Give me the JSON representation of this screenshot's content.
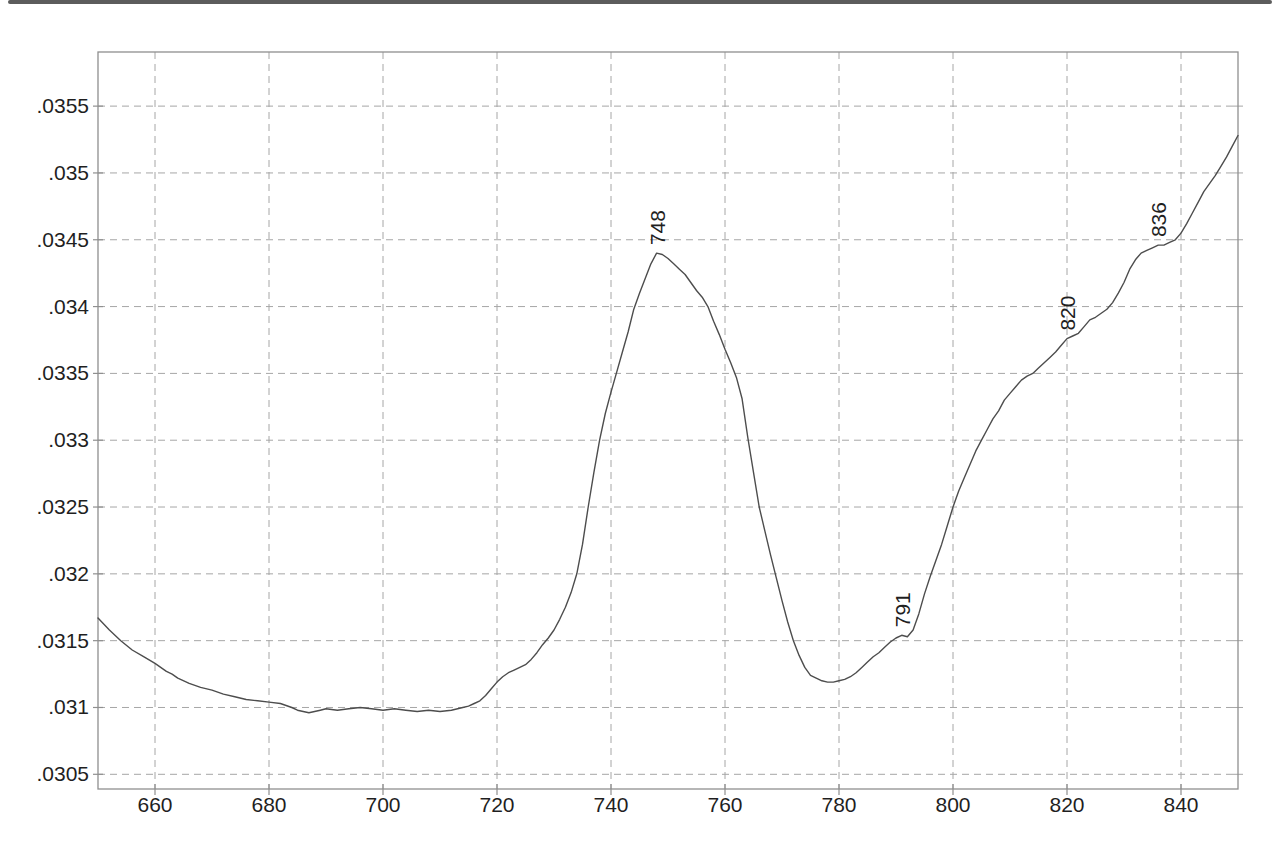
{
  "page": {
    "kind": "scanned-spectrum-plot",
    "background": "#ffffff"
  },
  "chart_data": {
    "type": "line",
    "title": "",
    "xlabel": "",
    "ylabel": "",
    "legend": "none",
    "grid": "dashed-both-axes",
    "xlim": [
      650,
      850
    ],
    "ylim": [
      0.03039,
      0.035905
    ],
    "x_ticks": [
      {
        "value": 660,
        "label": "660"
      },
      {
        "value": 680,
        "label": "680"
      },
      {
        "value": 700,
        "label": "700"
      },
      {
        "value": 720,
        "label": "720"
      },
      {
        "value": 740,
        "label": "740"
      },
      {
        "value": 760,
        "label": "760"
      },
      {
        "value": 780,
        "label": "780"
      },
      {
        "value": 800,
        "label": "800"
      },
      {
        "value": 820,
        "label": "820"
      },
      {
        "value": 840,
        "label": "840"
      }
    ],
    "y_ticks": [
      {
        "value": 0.0355,
        "label": ".0355"
      },
      {
        "value": 0.035,
        "label": ".035"
      },
      {
        "value": 0.0345,
        "label": ".0345"
      },
      {
        "value": 0.034,
        "label": ".034"
      },
      {
        "value": 0.0335,
        "label": ".0335"
      },
      {
        "value": 0.033,
        "label": ".033"
      },
      {
        "value": 0.0325,
        "label": ".0325"
      },
      {
        "value": 0.032,
        "label": ".032"
      },
      {
        "value": 0.0315,
        "label": ".0315"
      },
      {
        "value": 0.031,
        "label": ".031"
      },
      {
        "value": 0.0305,
        "label": ".0305"
      }
    ],
    "annotations": [
      {
        "label": "748",
        "x": 748,
        "y": 0.0344
      },
      {
        "label": "791",
        "x": 791,
        "y": 0.03154
      },
      {
        "label": "820",
        "x": 820,
        "y": 0.03376
      },
      {
        "label": "836",
        "x": 836,
        "y": 0.03446
      }
    ],
    "series": [
      {
        "name": "spectrum",
        "points": [
          [
            650,
            0.03167
          ],
          [
            652,
            0.03158
          ],
          [
            654,
            0.0315
          ],
          [
            656,
            0.03143
          ],
          [
            658,
            0.03138
          ],
          [
            660,
            0.03133
          ],
          [
            662,
            0.03127
          ],
          [
            663,
            0.03125
          ],
          [
            664,
            0.03122
          ],
          [
            666,
            0.03118
          ],
          [
            668,
            0.03115
          ],
          [
            670,
            0.03113
          ],
          [
            672,
            0.0311
          ],
          [
            674,
            0.03108
          ],
          [
            676,
            0.03106
          ],
          [
            678,
            0.03105
          ],
          [
            680,
            0.03104
          ],
          [
            682,
            0.03103
          ],
          [
            684,
            0.031
          ],
          [
            685,
            0.03098
          ],
          [
            686,
            0.03097
          ],
          [
            687,
            0.03096
          ],
          [
            688,
            0.03097
          ],
          [
            689,
            0.03098
          ],
          [
            690,
            0.03099
          ],
          [
            692,
            0.03098
          ],
          [
            694,
            0.03099
          ],
          [
            696,
            0.031
          ],
          [
            698,
            0.03099
          ],
          [
            700,
            0.03098
          ],
          [
            702,
            0.03099
          ],
          [
            704,
            0.03098
          ],
          [
            706,
            0.03097
          ],
          [
            708,
            0.03098
          ],
          [
            710,
            0.03097
          ],
          [
            712,
            0.03098
          ],
          [
            714,
            0.031
          ],
          [
            715,
            0.03101
          ],
          [
            716,
            0.03103
          ],
          [
            717,
            0.03105
          ],
          [
            718,
            0.03109
          ],
          [
            719,
            0.03114
          ],
          [
            720,
            0.03119
          ],
          [
            721,
            0.03123
          ],
          [
            722,
            0.03126
          ],
          [
            723,
            0.03128
          ],
          [
            724,
            0.0313
          ],
          [
            725,
            0.03132
          ],
          [
            726,
            0.03136
          ],
          [
            727,
            0.03141
          ],
          [
            728,
            0.03147
          ],
          [
            729,
            0.03152
          ],
          [
            730,
            0.03158
          ],
          [
            731,
            0.03166
          ],
          [
            732,
            0.03175
          ],
          [
            733,
            0.03186
          ],
          [
            734,
            0.032
          ],
          [
            735,
            0.03222
          ],
          [
            736,
            0.0325
          ],
          [
            737,
            0.03276
          ],
          [
            738,
            0.033
          ],
          [
            739,
            0.0332
          ],
          [
            740,
            0.03336
          ],
          [
            741,
            0.03351
          ],
          [
            742,
            0.03366
          ],
          [
            743,
            0.03381
          ],
          [
            744,
            0.03398
          ],
          [
            745,
            0.0341
          ],
          [
            746,
            0.03421
          ],
          [
            747,
            0.03432
          ],
          [
            748,
            0.0344
          ],
          [
            749,
            0.03439
          ],
          [
            750,
            0.03436
          ],
          [
            751,
            0.03432
          ],
          [
            752,
            0.03428
          ],
          [
            753,
            0.03424
          ],
          [
            754,
            0.03418
          ],
          [
            755,
            0.03412
          ],
          [
            756,
            0.03407
          ],
          [
            757,
            0.034
          ],
          [
            758,
            0.03389
          ],
          [
            759,
            0.03379
          ],
          [
            760,
            0.03368
          ],
          [
            761,
            0.03358
          ],
          [
            762,
            0.03347
          ],
          [
            763,
            0.03331
          ],
          [
            764,
            0.03302
          ],
          [
            765,
            0.03276
          ],
          [
            766,
            0.0325
          ],
          [
            767,
            0.03232
          ],
          [
            768,
            0.03214
          ],
          [
            769,
            0.03197
          ],
          [
            770,
            0.0318
          ],
          [
            771,
            0.03164
          ],
          [
            772,
            0.0315
          ],
          [
            773,
            0.03139
          ],
          [
            774,
            0.0313
          ],
          [
            775,
            0.03124
          ],
          [
            776,
            0.03122
          ],
          [
            777,
            0.0312
          ],
          [
            778,
            0.03119
          ],
          [
            779,
            0.03119
          ],
          [
            780,
            0.0312
          ],
          [
            781,
            0.03121
          ],
          [
            782,
            0.03123
          ],
          [
            783,
            0.03126
          ],
          [
            784,
            0.0313
          ],
          [
            785,
            0.03134
          ],
          [
            786,
            0.03138
          ],
          [
            787,
            0.03141
          ],
          [
            788,
            0.03145
          ],
          [
            789,
            0.03149
          ],
          [
            790,
            0.03152
          ],
          [
            791,
            0.03154
          ],
          [
            792,
            0.03153
          ],
          [
            793,
            0.03158
          ],
          [
            794,
            0.0317
          ],
          [
            795,
            0.03185
          ],
          [
            796,
            0.03198
          ],
          [
            797,
            0.0321
          ],
          [
            798,
            0.03222
          ],
          [
            799,
            0.03236
          ],
          [
            800,
            0.0325
          ],
          [
            801,
            0.03262
          ],
          [
            802,
            0.03272
          ],
          [
            803,
            0.03282
          ],
          [
            804,
            0.03292
          ],
          [
            805,
            0.033
          ],
          [
            806,
            0.03308
          ],
          [
            807,
            0.03316
          ],
          [
            808,
            0.03322
          ],
          [
            809,
            0.0333
          ],
          [
            810,
            0.03335
          ],
          [
            811,
            0.0334
          ],
          [
            812,
            0.03345
          ],
          [
            813,
            0.03348
          ],
          [
            814,
            0.0335
          ],
          [
            815,
            0.03354
          ],
          [
            816,
            0.03358
          ],
          [
            817,
            0.03362
          ],
          [
            818,
            0.03366
          ],
          [
            819,
            0.03371
          ],
          [
            820,
            0.03376
          ],
          [
            821,
            0.03378
          ],
          [
            822,
            0.0338
          ],
          [
            823,
            0.03385
          ],
          [
            824,
            0.0339
          ],
          [
            825,
            0.03392
          ],
          [
            826,
            0.03395
          ],
          [
            827,
            0.03398
          ],
          [
            828,
            0.03403
          ],
          [
            829,
            0.0341
          ],
          [
            830,
            0.03418
          ],
          [
            831,
            0.03428
          ],
          [
            832,
            0.03435
          ],
          [
            833,
            0.0344
          ],
          [
            834,
            0.03442
          ],
          [
            835,
            0.03444
          ],
          [
            836,
            0.03446
          ],
          [
            837,
            0.03446
          ],
          [
            838,
            0.03448
          ],
          [
            839,
            0.0345
          ],
          [
            840,
            0.03455
          ],
          [
            841,
            0.03462
          ],
          [
            842,
            0.0347
          ],
          [
            843,
            0.03478
          ],
          [
            844,
            0.03486
          ],
          [
            845,
            0.03492
          ],
          [
            846,
            0.03498
          ],
          [
            847,
            0.03505
          ],
          [
            848,
            0.03512
          ],
          [
            849,
            0.0352
          ],
          [
            850,
            0.03528
          ]
        ]
      }
    ],
    "colors": {
      "curve": "#4d4d4d",
      "grid": "#a6a6a6",
      "frame": "#8f8f8f",
      "text": "#1f1f1f",
      "scan_artifact": "#3f3f3f"
    }
  }
}
